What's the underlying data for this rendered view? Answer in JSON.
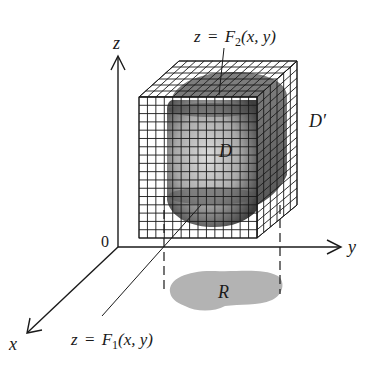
{
  "figure": {
    "labels": {
      "z_axis": "z",
      "y_axis": "y",
      "x_axis": "x",
      "origin": "0",
      "upper_surface": {
        "lhs": "z",
        "eq": "=",
        "fn": "F",
        "sub": "2",
        "args": "(x, y)"
      },
      "lower_surface": {
        "lhs": "z",
        "eq": "=",
        "fn": "F",
        "sub": "1",
        "args": "(x, y)"
      },
      "region_D": "D",
      "box_D_prime": "D′",
      "region_R": "R"
    },
    "grid": {
      "front_columns": 14,
      "front_rows": 17,
      "depth_cells": 6
    },
    "colors": {
      "line": "#1a1a1a",
      "solid_dark": "#3a3a3a",
      "solid_light": "#d8d8d8",
      "region_R": "#b3b3b3",
      "background": "#ffffff"
    }
  }
}
